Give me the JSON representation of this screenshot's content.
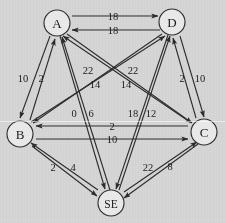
{
  "figure": {
    "kind": "directed-weighted-graph",
    "background_color": "#d6d6d6",
    "line_color": "#2b2b2b",
    "text_color": "#181818",
    "width": 225,
    "height": 223
  },
  "nodes": [
    {
      "id": "A",
      "label": "A",
      "x": 57,
      "y": 23,
      "r": 13
    },
    {
      "id": "D",
      "label": "D",
      "x": 172,
      "y": 22,
      "r": 13
    },
    {
      "id": "B",
      "label": "B",
      "x": 20,
      "y": 134,
      "r": 13
    },
    {
      "id": "C",
      "label": "C",
      "x": 204,
      "y": 132,
      "r": 13
    },
    {
      "id": "SE",
      "label": "SE",
      "x": 111,
      "y": 203,
      "r": 13
    }
  ],
  "edges": [
    {
      "from": "A",
      "to": "D",
      "weight": "18"
    },
    {
      "from": "D",
      "to": "A",
      "weight": "18"
    },
    {
      "from": "A",
      "to": "B",
      "weight": "10"
    },
    {
      "from": "B",
      "to": "A",
      "weight": "2"
    },
    {
      "from": "D",
      "to": "C",
      "weight": "10"
    },
    {
      "from": "C",
      "to": "D",
      "weight": "2"
    },
    {
      "from": "B",
      "to": "C",
      "weight": "10"
    },
    {
      "from": "C",
      "to": "B",
      "weight": "2"
    },
    {
      "from": "B",
      "to": "SE",
      "weight": "2"
    },
    {
      "from": "SE",
      "to": "B",
      "weight": "4"
    },
    {
      "from": "C",
      "to": "SE",
      "weight": "8"
    },
    {
      "from": "SE",
      "to": "C",
      "weight": "22"
    },
    {
      "from": "A",
      "to": "C",
      "weight": "22"
    },
    {
      "from": "C",
      "to": "A",
      "weight": "14"
    },
    {
      "from": "D",
      "to": "B",
      "weight": "22"
    },
    {
      "from": "B",
      "to": "D",
      "weight": "14"
    },
    {
      "from": "A",
      "to": "SE",
      "weight": "0"
    },
    {
      "from": "SE",
      "to": "A",
      "weight": "6"
    },
    {
      "from": "D",
      "to": "SE",
      "weight": "18"
    },
    {
      "from": "SE",
      "to": "D",
      "weight": "12"
    }
  ],
  "weight_labels": [
    {
      "text": "18",
      "x": 113,
      "y": 16,
      "name": "weight-a-to-d"
    },
    {
      "text": "18",
      "x": 113,
      "y": 30,
      "name": "weight-d-to-a"
    },
    {
      "text": "10",
      "x": 23,
      "y": 78,
      "name": "weight-a-to-b"
    },
    {
      "text": "2",
      "x": 41,
      "y": 78,
      "name": "weight-b-to-a"
    },
    {
      "text": "2",
      "x": 182,
      "y": 78,
      "name": "weight-c-to-d"
    },
    {
      "text": "10",
      "x": 200,
      "y": 78,
      "name": "weight-d-to-c"
    },
    {
      "text": "22",
      "x": 88,
      "y": 70,
      "name": "weight-a-to-c"
    },
    {
      "text": "14",
      "x": 95,
      "y": 84,
      "name": "weight-c-to-a"
    },
    {
      "text": "22",
      "x": 133,
      "y": 70,
      "name": "weight-d-to-b"
    },
    {
      "text": "14",
      "x": 126,
      "y": 84,
      "name": "weight-b-to-d"
    },
    {
      "text": "0",
      "x": 74,
      "y": 113,
      "name": "weight-a-to-se"
    },
    {
      "text": "6",
      "x": 91,
      "y": 113,
      "name": "weight-se-to-a"
    },
    {
      "text": "18",
      "x": 133,
      "y": 113,
      "name": "weight-d-to-se"
    },
    {
      "text": "12",
      "x": 151,
      "y": 113,
      "name": "weight-se-to-d"
    },
    {
      "text": "2",
      "x": 112,
      "y": 126,
      "name": "weight-c-to-b"
    },
    {
      "text": "10",
      "x": 112,
      "y": 139,
      "name": "weight-b-to-c"
    },
    {
      "text": "2",
      "x": 53,
      "y": 167,
      "name": "weight-se-to-b"
    },
    {
      "text": "4",
      "x": 73,
      "y": 167,
      "name": "weight-b-to-se"
    },
    {
      "text": "22",
      "x": 148,
      "y": 167,
      "name": "weight-se-to-c"
    },
    {
      "text": "8",
      "x": 170,
      "y": 166,
      "name": "weight-c-to-se"
    }
  ],
  "edge_paths": [
    {
      "name": "edge-a-to-d",
      "x1": 72,
      "y1": 16,
      "x2": 158,
      "y2": 16
    },
    {
      "name": "edge-d-to-a",
      "x1": 160,
      "y1": 30,
      "x2": 72,
      "y2": 30
    },
    {
      "name": "edge-a-to-b",
      "x1": 50,
      "y1": 36,
      "x2": 20,
      "y2": 118
    },
    {
      "name": "edge-b-to-a",
      "x1": 30,
      "y1": 120,
      "x2": 55,
      "y2": 39
    },
    {
      "name": "edge-d-to-c",
      "x1": 180,
      "y1": 36,
      "x2": 204,
      "y2": 117
    },
    {
      "name": "edge-c-to-d",
      "x1": 196,
      "y1": 118,
      "x2": 173,
      "y2": 38
    },
    {
      "name": "edge-b-to-c",
      "x1": 36,
      "y1": 139,
      "x2": 188,
      "y2": 139
    },
    {
      "name": "edge-c-to-b",
      "x1": 188,
      "y1": 126,
      "x2": 36,
      "y2": 126
    },
    {
      "name": "edge-b-to-se",
      "x1": 32,
      "y1": 146,
      "x2": 97,
      "y2": 196
    },
    {
      "name": "edge-se-to-b",
      "x1": 98,
      "y1": 190,
      "x2": 31,
      "y2": 143
    },
    {
      "name": "edge-c-to-se",
      "x1": 198,
      "y1": 144,
      "x2": 124,
      "y2": 198
    },
    {
      "name": "edge-se-to-c",
      "x1": 124,
      "y1": 192,
      "x2": 197,
      "y2": 142
    },
    {
      "name": "edge-a-to-c",
      "x1": 67,
      "y1": 34,
      "x2": 192,
      "y2": 123
    },
    {
      "name": "edge-c-to-a",
      "x1": 190,
      "y1": 122,
      "x2": 63,
      "y2": 36
    },
    {
      "name": "edge-d-to-b",
      "x1": 162,
      "y1": 34,
      "x2": 33,
      "y2": 123
    },
    {
      "name": "edge-b-to-d",
      "x1": 31,
      "y1": 122,
      "x2": 165,
      "y2": 36
    },
    {
      "name": "edge-a-to-se",
      "x1": 60,
      "y1": 36,
      "x2": 105,
      "y2": 189
    },
    {
      "name": "edge-se-to-a",
      "x1": 110,
      "y1": 190,
      "x2": 62,
      "y2": 37
    },
    {
      "name": "edge-d-to-se",
      "x1": 168,
      "y1": 35,
      "x2": 116,
      "y2": 189
    },
    {
      "name": "edge-se-to-d",
      "x1": 119,
      "y1": 190,
      "x2": 170,
      "y2": 36
    }
  ]
}
